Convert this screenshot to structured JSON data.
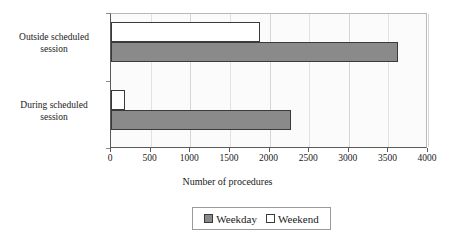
{
  "chart_data": {
    "type": "bar",
    "orientation": "horizontal",
    "title": "",
    "xlabel": "Number of procedures",
    "ylabel": "",
    "xlim": [
      0,
      4000
    ],
    "xticks": [
      "0",
      "500",
      "1000",
      "1500",
      "2000",
      "2500",
      "3000",
      "3500",
      "4000"
    ],
    "xtick_values": [
      0,
      500,
      1000,
      1500,
      2000,
      2500,
      3000,
      3500,
      4000
    ],
    "categories": [
      "Outside scheduled session",
      "During scheduled session"
    ],
    "grid": true,
    "legend_position": "bottom",
    "series": [
      {
        "name": "Weekday",
        "color": "#8a8a8a",
        "values": [
          3620,
          2270
        ]
      },
      {
        "name": "Weekend",
        "color": "#ffffff",
        "values": [
          1875,
          175
        ]
      }
    ]
  },
  "legend": {
    "entries": [
      {
        "label": "Weekday",
        "swatch": "weekday"
      },
      {
        "label": "Weekend",
        "swatch": "weekend"
      }
    ]
  },
  "category_labels": [
    {
      "line1": "Outside scheduled",
      "line2": "session"
    },
    {
      "line1": "During scheduled",
      "line2": "session"
    }
  ],
  "colors": {
    "weekday_fill": "#8a8a8a",
    "weekend_fill": "#ffffff",
    "bar_outline": "#3a3a3a",
    "axis": "#5a5a5a",
    "plot_background": "#fbfbfb",
    "gridline": "#e2e2e2"
  }
}
